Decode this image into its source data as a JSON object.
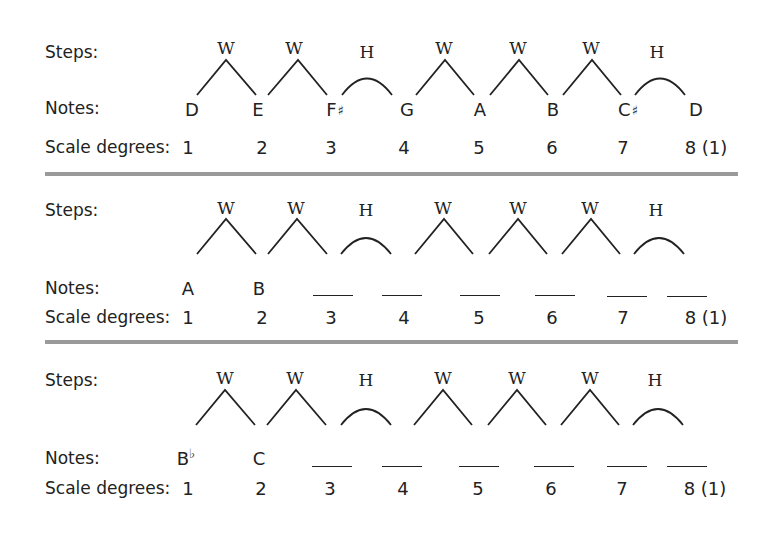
{
  "labels": {
    "steps": "Steps:",
    "notes": "Notes:",
    "scale_degrees": "Scale degrees:"
  },
  "step_pattern": [
    "W",
    "W",
    "H",
    "W",
    "W",
    "W",
    "H"
  ],
  "scale_degrees": [
    "1",
    "2",
    "3",
    "4",
    "5",
    "6",
    "7",
    "8 (1)"
  ],
  "sections": [
    {
      "title": "D major",
      "notes": [
        {
          "letter": "D",
          "accidental": ""
        },
        {
          "letter": "E",
          "accidental": ""
        },
        {
          "letter": "F",
          "accidental": "♯"
        },
        {
          "letter": "G",
          "accidental": ""
        },
        {
          "letter": "A",
          "accidental": ""
        },
        {
          "letter": "B",
          "accidental": ""
        },
        {
          "letter": "C",
          "accidental": "♯"
        },
        {
          "letter": "D",
          "accidental": ""
        }
      ]
    },
    {
      "title": "A major exercise",
      "notes": [
        {
          "letter": "A",
          "accidental": ""
        },
        {
          "letter": "B",
          "accidental": ""
        },
        {
          "letter": "",
          "accidental": "",
          "blank": true
        },
        {
          "letter": "",
          "accidental": "",
          "blank": true
        },
        {
          "letter": "",
          "accidental": "",
          "blank": true
        },
        {
          "letter": "",
          "accidental": "",
          "blank": true
        },
        {
          "letter": "",
          "accidental": "",
          "blank": true
        },
        {
          "letter": "",
          "accidental": "",
          "blank": true
        }
      ]
    },
    {
      "title": "B-flat major exercise",
      "notes": [
        {
          "letter": "B",
          "accidental": "♭"
        },
        {
          "letter": "C",
          "accidental": ""
        },
        {
          "letter": "",
          "accidental": "",
          "blank": true
        },
        {
          "letter": "",
          "accidental": "",
          "blank": true
        },
        {
          "letter": "",
          "accidental": "",
          "blank": true
        },
        {
          "letter": "",
          "accidental": "",
          "blank": true
        },
        {
          "letter": "",
          "accidental": "",
          "blank": true
        },
        {
          "letter": "",
          "accidental": "",
          "blank": true
        }
      ]
    }
  ],
  "colors": {
    "ink": "#222222",
    "separator": "#9a9a9a",
    "background": "#ffffff"
  }
}
